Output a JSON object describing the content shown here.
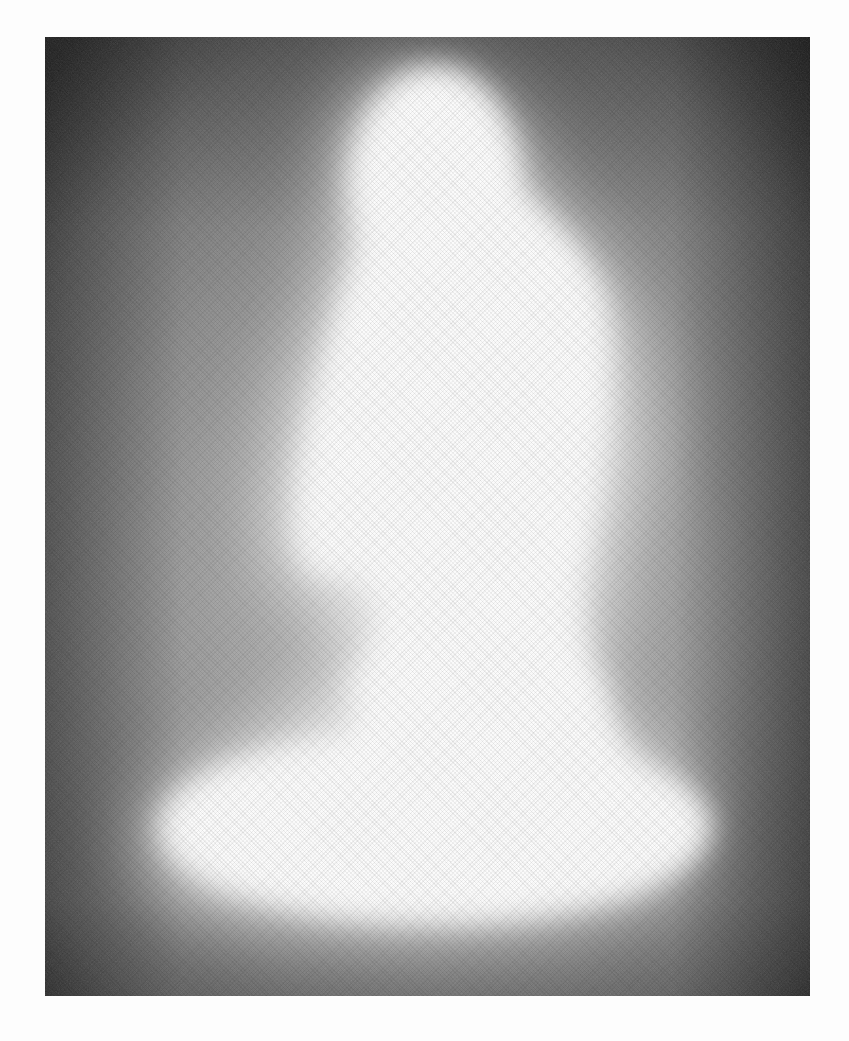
{
  "page": {
    "cropped_heading_text": "",
    "background_color": "#fdfdfd"
  },
  "plate": {
    "description": "Grayscale photographic plate: bright white glowing silhouette (narrow rounded top, widening body, broad oval base) on a dithered dark-gray background",
    "frame": {
      "x": 45,
      "y": 37,
      "width": 765,
      "height": 959
    },
    "colors": {
      "glow": "#ffffff",
      "background_light": "#b8b8b8",
      "background_mid": "#8a8a8a",
      "background_dark": "#4a4a4a",
      "corner_dark": "#3c3c3c"
    }
  }
}
